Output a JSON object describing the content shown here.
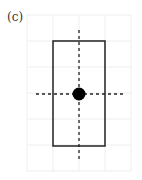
{
  "panel_label": "(c)",
  "grid": {
    "x0": 27,
    "y0": 15,
    "cols": 4,
    "rows": 6,
    "cell": 26,
    "color": "#eeeeee"
  },
  "rectangle": {
    "x": 53,
    "y": 41,
    "width": 52,
    "height": 105,
    "stroke": "#222222",
    "stroke_width": 1.5
  },
  "dashed_lines": {
    "vertical": {
      "x": 79,
      "y1": 30,
      "y2": 160
    },
    "horizontal": {
      "y": 94,
      "x1": 36,
      "x2": 123
    },
    "color": "#222222",
    "dash": "3,3"
  },
  "center_dot": {
    "cx": 79,
    "cy": 94,
    "r": 6.5,
    "fill": "#000000"
  }
}
